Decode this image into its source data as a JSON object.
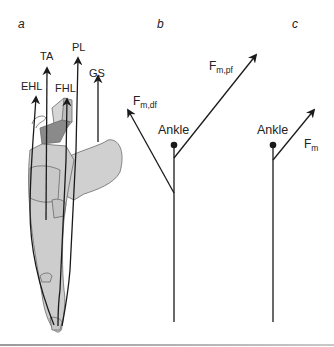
{
  "panels": {
    "a": {
      "label": "a",
      "muscles": [
        "EHL",
        "TA",
        "FHL",
        "PL",
        "GS"
      ]
    },
    "b": {
      "label": "b",
      "joint_label": "Ankle",
      "force_df": {
        "main": "F",
        "sub": "m,df"
      },
      "force_pf": {
        "main": "F",
        "sub": "m,pf"
      }
    },
    "c": {
      "label": "c",
      "joint_label": "Ankle",
      "force": {
        "main": "F",
        "sub": "m"
      }
    }
  },
  "colors": {
    "line": "#1a1a1a",
    "bone_fill": "#cfcfcf",
    "bone_dark": "#7a7a7a",
    "bone_outline": "#6a6a6a"
  }
}
